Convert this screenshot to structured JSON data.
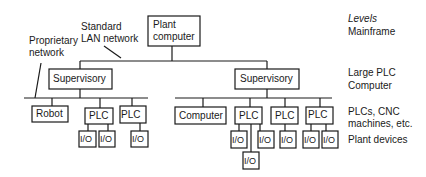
{
  "diagram": {
    "annotations": {
      "standard_lan": [
        "Standard",
        "LAN network"
      ],
      "proprietary": [
        "Proprietary",
        "network"
      ]
    },
    "nodes": {
      "plant_computer": [
        "Plant",
        "computer"
      ],
      "supervisory_left": "Supervisory",
      "supervisory_right": "Supervisory",
      "robot": "Robot",
      "plc_left_1": "PLC",
      "plc_left_2": "PLC",
      "computer": "Computer",
      "plc_right_1": "PLC",
      "plc_right_2": "PLC",
      "plc_right_3": "PLC",
      "io": "I/O"
    },
    "levels": {
      "header": "Levels",
      "mainframe": "Mainframe",
      "large_plc": [
        "Large PLC",
        "Computer"
      ],
      "plcs": [
        "PLCs, CNC",
        "machines, etc."
      ],
      "plant_devices": "Plant devices"
    },
    "colors": {
      "line": "#1a1a1a",
      "background": "#ffffff"
    }
  }
}
